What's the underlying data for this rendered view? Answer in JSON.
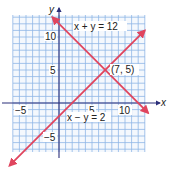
{
  "chart_data": {
    "type": "line",
    "title": "",
    "xlabel": "x",
    "ylabel": "y",
    "xlim": [
      -7,
      13
    ],
    "ylim": [
      -7,
      13
    ],
    "grid": true,
    "x_ticks": [
      -5,
      5,
      10
    ],
    "y_ticks": [
      10,
      5,
      -5
    ],
    "x_tick_labels": [
      "−5",
      "5",
      "10"
    ],
    "y_tick_labels": [
      "10",
      "5",
      "−5"
    ],
    "series": [
      {
        "name": "x + y = 12",
        "equation": "y = 12 - x",
        "slope": -1,
        "intercept": 12,
        "x": [
          -1,
          13.5
        ],
        "y": [
          13,
          -1.5
        ]
      },
      {
        "name": "x − y = 2",
        "equation": "y = x - 2",
        "slope": 1,
        "intercept": -2,
        "x": [
          -7.5,
          13
        ],
        "y": [
          -9.5,
          11
        ]
      }
    ],
    "annotations": [
      {
        "text": "x + y = 12",
        "x": 7.5,
        "y": 12
      },
      {
        "text": "x − y = 2",
        "x": 6.5,
        "y": -2
      },
      {
        "text": "(7, 5)",
        "x": 9.5,
        "y": 5,
        "point": [
          7,
          5
        ]
      }
    ],
    "colors": {
      "grid": "#8fb6e6",
      "axes": "#2b2f7a",
      "lines": "#e0455e",
      "background": "#ffffff"
    }
  },
  "labels": {
    "x_axis": "x",
    "y_axis": "y",
    "eq1": "x + y = 12",
    "eq2": "x − y = 2",
    "intersection": "(7, 5)",
    "tick_x_neg5": "−5",
    "tick_x_5": "5",
    "tick_x_10": "10",
    "tick_y_10": "10",
    "tick_y_5": "5",
    "tick_y_neg5": "−5"
  }
}
